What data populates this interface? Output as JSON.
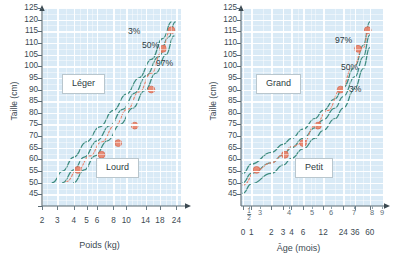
{
  "chart_data": [
    {
      "type": "line",
      "panel": "left",
      "title": "",
      "xlabel": "Poids (kg)",
      "ylabel": "Taille (cm)",
      "x_scale": "log",
      "xlim": [
        2,
        24
      ],
      "ylim": [
        40,
        125
      ],
      "xticks": [
        "2",
        "3",
        "4",
        "5",
        "6",
        "8",
        "10",
        "14",
        "18",
        "24"
      ],
      "xtick_values": [
        2,
        3,
        4,
        5,
        6,
        8,
        10,
        14,
        18,
        24
      ],
      "yticks": [
        "125",
        "120",
        "115",
        "110",
        "105",
        "100",
        "95",
        "90",
        "85",
        "80",
        "75",
        "70",
        "65",
        "60",
        "55",
        "50",
        "45"
      ],
      "ytick_values": [
        125,
        120,
        115,
        110,
        105,
        100,
        95,
        90,
        85,
        80,
        75,
        70,
        65,
        60,
        55,
        50,
        45
      ],
      "grid": true,
      "grid_color": "#ffffff",
      "plot_background": "#d9eaf6",
      "curve_color": "#3f8c80",
      "point_color": "#e8836b",
      "annotations": [
        {
          "text": "Léger",
          "kind": "callout"
        },
        {
          "text": "Lourd",
          "kind": "callout"
        },
        {
          "text": "3%",
          "kind": "percentile"
        },
        {
          "text": "50%",
          "kind": "percentile"
        },
        {
          "text": "97%",
          "kind": "percentile"
        }
      ],
      "series": [
        {
          "name": "3%",
          "x": [
            2.75,
            3.3,
            4.0,
            5.0,
            6.3,
            8.0,
            10.0,
            12.5,
            15.5,
            19.0,
            22.0
          ],
          "y": [
            50,
            55,
            61,
            67.5,
            74,
            81,
            88,
            95,
            103,
            112,
            119
          ]
        },
        {
          "name": "50%",
          "x": [
            3.3,
            4.0,
            4.8,
            6.0,
            7.5,
            9.4,
            11.6,
            14.2,
            17.5,
            21.0,
            23.5
          ],
          "y": [
            50,
            55.5,
            61,
            68,
            74.5,
            81.5,
            88.5,
            96,
            104,
            112.5,
            119
          ]
        },
        {
          "name": "97%",
          "x": [
            4.0,
            4.8,
            5.8,
            7.2,
            9.0,
            11.2,
            13.8,
            16.8,
            20.0,
            23.0
          ],
          "y": [
            50,
            55.5,
            61.5,
            68,
            75,
            82,
            89.5,
            97,
            105,
            113
          ]
        },
        {
          "name": "trajectoire",
          "x": [
            3.5,
            4.3,
            5.3,
            6.5,
            8.2,
            10.2,
            12.5,
            15.5,
            18.5,
            21.5
          ],
          "y": [
            50.5,
            55.5,
            61.5,
            67.5,
            74.5,
            81.5,
            89,
            97,
            106,
            115
          ]
        }
      ],
      "data_points": [
        {
          "x": 4.3,
          "y": 55.5
        },
        {
          "x": 6.5,
          "y": 62
        },
        {
          "x": 8.7,
          "y": 67
        },
        {
          "x": 11.6,
          "y": 74.5
        },
        {
          "x": 15.5,
          "y": 90
        },
        {
          "x": 19.0,
          "y": 107.5
        },
        {
          "x": 22.0,
          "y": 115.5
        }
      ]
    },
    {
      "type": "line",
      "panel": "right",
      "title": "",
      "xlabel": "Âge (mois)",
      "ylabel": "Taille (cm)",
      "x_scale": "log",
      "xlim": [
        0,
        60
      ],
      "ylim": [
        40,
        125
      ],
      "xticks": [
        "0",
        "1",
        "2",
        "3",
        "4",
        "6",
        "12",
        "24",
        "36",
        "60"
      ],
      "xtick_values": [
        0,
        1,
        2,
        3,
        4,
        6,
        12,
        24,
        36,
        60
      ],
      "xticks_secondary": [
        "1/2",
        "3",
        "4",
        "5",
        "6",
        "7",
        "8",
        "9"
      ],
      "yticks": [
        "125",
        "120",
        "115",
        "110",
        "105",
        "100",
        "95",
        "90",
        "85",
        "80",
        "75",
        "70",
        "65",
        "60",
        "55",
        "50",
        "45"
      ],
      "ytick_values": [
        125,
        120,
        115,
        110,
        105,
        100,
        95,
        90,
        85,
        80,
        75,
        70,
        65,
        60,
        55,
        50,
        45
      ],
      "grid": true,
      "grid_color": "#ffffff",
      "plot_background": "#d9eaf6",
      "curve_color": "#3f8c80",
      "point_color": "#e8836b",
      "annotations": [
        {
          "text": "Grand",
          "kind": "callout"
        },
        {
          "text": "Petit",
          "kind": "callout"
        },
        {
          "text": "97%",
          "kind": "percentile"
        },
        {
          "text": "50%",
          "kind": "percentile"
        },
        {
          "text": "3%",
          "kind": "percentile"
        }
      ],
      "series": [
        {
          "name": "97%",
          "x": [
            0.4,
            1,
            2,
            3,
            4,
            6,
            9,
            12,
            18,
            24,
            36,
            48,
            60
          ],
          "y": [
            54,
            58,
            63,
            66.5,
            69,
            73,
            77.5,
            81,
            86,
            91,
            100,
            109,
            119
          ]
        },
        {
          "name": "50%",
          "x": [
            0.4,
            1,
            2,
            3,
            4,
            6,
            9,
            12,
            18,
            24,
            36,
            48,
            60
          ],
          "y": [
            50,
            54,
            58.5,
            62,
            65,
            69,
            73.5,
            77,
            82,
            87,
            95.5,
            104,
            113.5
          ]
        },
        {
          "name": "3%",
          "x": [
            0.5,
            1,
            2,
            3,
            4,
            6,
            9,
            12,
            18,
            24,
            36,
            48,
            60
          ],
          "y": [
            45.5,
            49.5,
            54,
            57.5,
            60.5,
            64.5,
            69,
            72.5,
            77.5,
            82,
            90.5,
            99,
            108
          ]
        },
        {
          "name": "trajectoire",
          "x": [
            0.6,
            1.2,
            2,
            3,
            4,
            6,
            9,
            14,
            22,
            34,
            48,
            58
          ],
          "y": [
            49,
            55.5,
            58.5,
            62,
            65.5,
            67,
            74.5,
            81,
            90,
            100,
            108,
            115.5
          ]
        }
      ],
      "data_points": [
        {
          "x": 1.2,
          "y": 55.5
        },
        {
          "x": 3.2,
          "y": 62
        },
        {
          "x": 6.0,
          "y": 67
        },
        {
          "x": 10.0,
          "y": 74.5
        },
        {
          "x": 22.0,
          "y": 90
        },
        {
          "x": 40.0,
          "y": 107.5
        },
        {
          "x": 56.0,
          "y": 115.5
        }
      ]
    }
  ],
  "left": {
    "ylabel": "Taille (cm)",
    "xlabel": "Poids (kg)",
    "callout_top": "Léger",
    "callout_bottom": "Lourd",
    "pct_a": "3%",
    "pct_b": "50%",
    "pct_c": "97%"
  },
  "right": {
    "ylabel": "Taille (cm)",
    "xlabel": "Âge (mois)",
    "callout_top": "Grand",
    "callout_bottom": "Petit",
    "pct_a": "97%",
    "pct_b": "50%",
    "pct_c": "3%"
  }
}
